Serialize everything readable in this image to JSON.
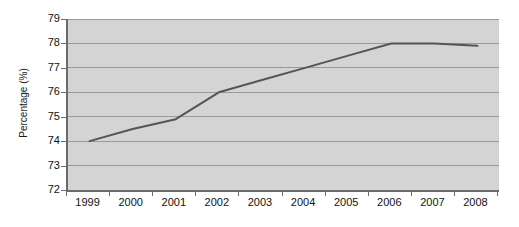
{
  "chart_data": {
    "type": "line",
    "title": "",
    "xlabel": "",
    "ylabel": "Percentage (%)",
    "categories": [
      "1999",
      "2000",
      "2001",
      "2002",
      "2003",
      "2004",
      "2005",
      "2006",
      "2007",
      "2008"
    ],
    "values": [
      74.0,
      74.5,
      74.9,
      76.0,
      76.5,
      77.0,
      77.5,
      78.0,
      78.0,
      77.9
    ],
    "series": [
      {
        "name": "Percentage",
        "values": [
          74.0,
          74.5,
          74.9,
          76.0,
          76.5,
          77.0,
          77.5,
          78.0,
          78.0,
          77.9
        ]
      }
    ],
    "ylim": [
      72,
      79
    ],
    "xlim": [
      "1999",
      "2008"
    ],
    "ytick_labels": [
      "79",
      "78",
      "77",
      "76",
      "75",
      "74",
      "73",
      "72"
    ],
    "yticks": [
      79,
      78,
      77,
      76,
      75,
      74,
      73,
      72
    ],
    "xtick_labels": [
      "1999",
      "2000",
      "2001",
      "2002",
      "2003",
      "2004",
      "2005",
      "2006",
      "2007",
      "2008"
    ],
    "grid": true,
    "grid_axis": "y",
    "legend": false,
    "legend_position": "none",
    "colors": {
      "line": "#555555",
      "plot_background": "#d4d4d4",
      "canvas_background": "#ffffff",
      "gridline": "#9a9a9a",
      "axis": "#6b6b6b",
      "text": "#111111"
    }
  }
}
